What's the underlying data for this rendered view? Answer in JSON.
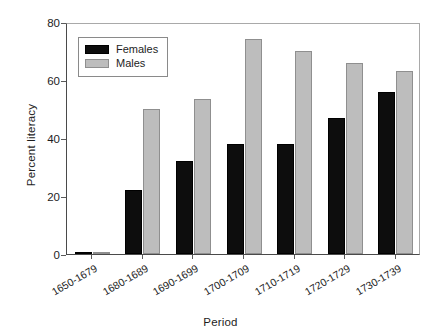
{
  "chart_data": {
    "type": "bar",
    "title": "",
    "xlabel": "Period",
    "ylabel": "Percent literacy",
    "categories": [
      "1650-1679",
      "1680-1689",
      "1690-1699",
      "1700-1709",
      "1710-1719",
      "1720-1729",
      "1730-1739"
    ],
    "series": [
      {
        "name": "Females",
        "color": "#0d0d0d",
        "values": [
          0.5,
          22,
          32,
          38,
          38,
          47,
          56
        ]
      },
      {
        "name": "Males",
        "color": "#bdbdbd",
        "values": [
          0.5,
          50,
          53.5,
          74,
          70,
          66,
          63
        ]
      }
    ],
    "ylim": [
      0,
      80
    ],
    "yticks": [
      0,
      20,
      40,
      60,
      80
    ],
    "ytick_labels": [
      "0",
      "20",
      "40",
      "60",
      "80"
    ],
    "grid": false,
    "legend_position": "upper-left-inside",
    "xtick_label_rotation": -30
  },
  "legend": {
    "entries": [
      {
        "label": "Females",
        "swatch": "black-swatch"
      },
      {
        "label": "Males",
        "swatch": "gray-swatch"
      }
    ]
  }
}
